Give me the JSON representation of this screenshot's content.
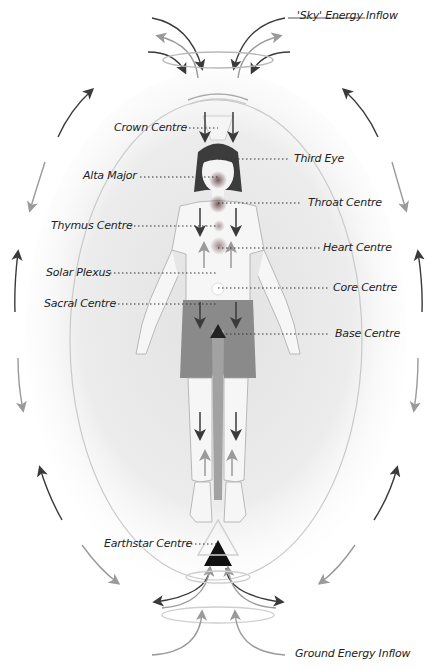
{
  "diagram": {
    "type": "energy-body chakra diagram",
    "flows": {
      "sky": "'Sky' Energy Inflow",
      "ground": "Ground Energy Inflow"
    },
    "centres": [
      {
        "id": "crown",
        "label": "Crown Centre",
        "side": "left"
      },
      {
        "id": "third-eye",
        "label": "Third Eye",
        "side": "right"
      },
      {
        "id": "alta-major",
        "label": "Alta Major",
        "side": "left"
      },
      {
        "id": "throat",
        "label": "Throat Centre",
        "side": "right"
      },
      {
        "id": "thymus",
        "label": "Thymus Centre",
        "side": "left"
      },
      {
        "id": "heart",
        "label": "Heart Centre",
        "side": "right"
      },
      {
        "id": "solar-plexus",
        "label": "Solar Plexus",
        "side": "left"
      },
      {
        "id": "core",
        "label": "Core Centre",
        "side": "right"
      },
      {
        "id": "sacral",
        "label": "Sacral Centre",
        "side": "left"
      },
      {
        "id": "base",
        "label": "Base Centre",
        "side": "right"
      },
      {
        "id": "earthstar",
        "label": "Earthstar Centre",
        "side": "left"
      }
    ],
    "colors": {
      "dark_arrow": "#3a3a3a",
      "light_arrow": "#9a9a9a",
      "aura": "#d8d8d8",
      "shorts": "#8a8a8a",
      "hair": "#3c3c3c",
      "centre_dot": "#8e6a6a"
    }
  }
}
